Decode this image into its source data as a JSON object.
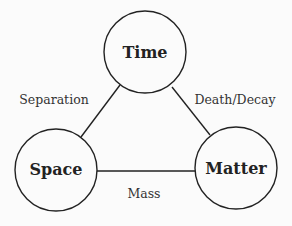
{
  "diagram": {
    "nodes": [
      {
        "id": "time",
        "label": "Time",
        "cx": 145,
        "cy": 52,
        "r": 41
      },
      {
        "id": "space",
        "label": "Space",
        "cx": 56,
        "cy": 170,
        "r": 41
      },
      {
        "id": "matter",
        "label": "Matter",
        "cx": 236,
        "cy": 168,
        "r": 41
      }
    ],
    "edges": [
      {
        "from": "time",
        "to": "space",
        "label": "Separation"
      },
      {
        "from": "time",
        "to": "matter",
        "label": "Death/Decay"
      },
      {
        "from": "space",
        "to": "matter",
        "label": "Mass"
      }
    ],
    "colors": {
      "stroke": "#222222",
      "background": "#fbfbfb"
    }
  }
}
